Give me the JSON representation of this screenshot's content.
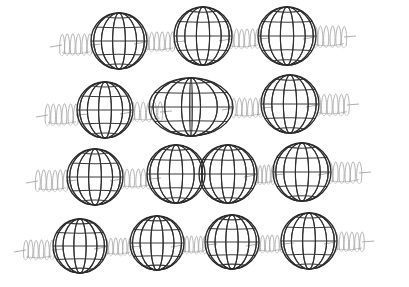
{
  "figure": {
    "background_color": "#ffffff",
    "sphere_line_color": "#2b2b2b",
    "spring_line_color": "#a8a8a8",
    "connector_line_color": "#9a9a9a",
    "canvas": {
      "width": 409,
      "height": 287
    }
  },
  "style": {
    "sphere_longitudes": 7,
    "sphere_latitudes": 5,
    "sphere_stroke_width": 1.1,
    "spring_stroke_width": 0.85,
    "spring_turns": 5
  },
  "chart_data": {
    "type": "diagram",
    "xlabel": "",
    "ylabel": "",
    "rows": [
      {
        "index": 1,
        "name": "row-1-three-spheres",
        "baseline_y": 40,
        "spheres": [
          {
            "cx": 119,
            "cy": 41,
            "r": 28,
            "shape": "sphere"
          },
          {
            "cx": 203,
            "cy": 36,
            "r": 29,
            "shape": "sphere"
          },
          {
            "cx": 287,
            "cy": 36,
            "r": 29,
            "shape": "sphere"
          }
        ],
        "springs": [
          {
            "x1": 62,
            "x2": 90,
            "y": 45,
            "amp": 11,
            "turns": 5
          },
          {
            "x1": 146,
            "x2": 173,
            "y": 42,
            "amp": 10,
            "turns": 5
          },
          {
            "x1": 231,
            "x2": 258,
            "y": 39,
            "amp": 10,
            "turns": 5
          },
          {
            "x1": 315,
            "x2": 344,
            "y": 37,
            "amp": 11,
            "turns": 5
          }
        ]
      },
      {
        "index": 2,
        "name": "row-2-fused-dimer",
        "baseline_y": 109,
        "spheres": [
          {
            "cx": 105,
            "cy": 110,
            "r": 28,
            "shape": "sphere"
          },
          {
            "cx": 191,
            "cy": 107,
            "r": 29,
            "shape": "ellipsoid-dimer",
            "rx": 42,
            "ry": 29
          },
          {
            "cx": 290,
            "cy": 104,
            "r": 29,
            "shape": "sphere"
          }
        ],
        "springs": [
          {
            "x1": 48,
            "x2": 76,
            "y": 115,
            "amp": 11,
            "turns": 5
          },
          {
            "x1": 132,
            "x2": 160,
            "y": 112,
            "amp": 10,
            "turns": 5
          },
          {
            "x1": 234,
            "x2": 261,
            "y": 108,
            "amp": 10,
            "turns": 5
          },
          {
            "x1": 318,
            "x2": 347,
            "y": 105,
            "amp": 11,
            "turns": 5
          }
        ]
      },
      {
        "index": 3,
        "name": "row-3-tangent-pair",
        "baseline_y": 176,
        "spheres": [
          {
            "cx": 95,
            "cy": 177,
            "r": 28,
            "shape": "sphere"
          },
          {
            "cx": 176,
            "cy": 174,
            "r": 29,
            "shape": "sphere"
          },
          {
            "cx": 228,
            "cy": 174,
            "r": 29,
            "shape": "sphere"
          },
          {
            "cx": 302,
            "cy": 172,
            "r": 29,
            "shape": "sphere"
          }
        ],
        "springs": [
          {
            "x1": 38,
            "x2": 66,
            "y": 181,
            "amp": 11,
            "turns": 5
          },
          {
            "x1": 122,
            "x2": 149,
            "y": 179,
            "amp": 10,
            "turns": 5
          },
          {
            "x1": 256,
            "x2": 273,
            "y": 175,
            "amp": 10,
            "turns": 4
          },
          {
            "x1": 330,
            "x2": 359,
            "y": 173,
            "amp": 11,
            "turns": 5
          }
        ]
      },
      {
        "index": 4,
        "name": "row-4-four-spheres",
        "baseline_y": 245,
        "spheres": [
          {
            "cx": 80,
            "cy": 246,
            "r": 27,
            "shape": "sphere"
          },
          {
            "cx": 157,
            "cy": 243,
            "r": 27,
            "shape": "sphere"
          },
          {
            "cx": 232,
            "cy": 242,
            "r": 27,
            "shape": "sphere"
          },
          {
            "cx": 309,
            "cy": 241,
            "r": 28,
            "shape": "sphere"
          }
        ],
        "springs": [
          {
            "x1": 26,
            "x2": 52,
            "y": 250,
            "amp": 10,
            "turns": 5
          },
          {
            "x1": 106,
            "x2": 130,
            "y": 247,
            "amp": 9,
            "turns": 5
          },
          {
            "x1": 183,
            "x2": 205,
            "y": 245,
            "amp": 9,
            "turns": 5
          },
          {
            "x1": 258,
            "x2": 282,
            "y": 244,
            "amp": 9,
            "turns": 5
          },
          {
            "x1": 336,
            "x2": 362,
            "y": 242,
            "amp": 10,
            "turns": 5
          }
        ]
      }
    ]
  }
}
